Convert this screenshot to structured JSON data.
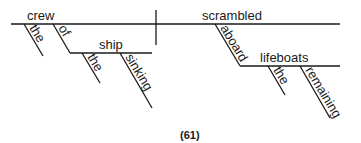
{
  "diagram": {
    "type": "sentence-diagram",
    "caption": "(61)",
    "subject": {
      "word": "crew",
      "modifiers": [
        {
          "word": "the",
          "role": "article"
        },
        {
          "word": "of",
          "role": "preposition",
          "object": {
            "word": "ship",
            "modifiers": [
              {
                "word": "the",
                "role": "article"
              },
              {
                "word": "sinking",
                "role": "participle"
              }
            ]
          }
        }
      ]
    },
    "predicate": {
      "word": "scrambled",
      "modifiers": [
        {
          "word": "aboard",
          "role": "preposition",
          "object": {
            "word": "lifeboats",
            "modifiers": [
              {
                "word": "the",
                "role": "article"
              },
              {
                "word": "remaining",
                "role": "participle"
              }
            ]
          }
        }
      ]
    }
  },
  "labels": {
    "crew": "crew",
    "the1": "the",
    "of": "of",
    "ship": "ship",
    "the2": "the",
    "sinking": "sinking",
    "scrambled": "scrambled",
    "aboard": "aboard",
    "lifeboats": "lifeboats",
    "the3": "the",
    "remaining": "remaining",
    "caption": "(61)"
  },
  "colors": {
    "ink": "#1a1a1a",
    "background": "#ffffff"
  }
}
